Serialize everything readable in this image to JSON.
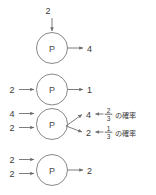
{
  "diagram": {
    "type": "process-node-flow",
    "node_label": "P",
    "rows": [
      {
        "id": "row-1",
        "inputs": [
          {
            "label": "2",
            "direction": "top"
          }
        ],
        "outputs": [
          {
            "label": "4",
            "direction": "right"
          }
        ]
      },
      {
        "id": "row-2",
        "inputs": [
          {
            "label": "2",
            "direction": "left"
          }
        ],
        "outputs": [
          {
            "label": "1",
            "direction": "right"
          }
        ]
      },
      {
        "id": "row-3",
        "inputs": [
          {
            "label": "4",
            "direction": "left"
          },
          {
            "label": "2",
            "direction": "left"
          }
        ],
        "outputs": [
          {
            "label": "4",
            "direction": "right",
            "probability": {
              "numerator": "2",
              "denominator": "3"
            },
            "annotation": "の確率"
          },
          {
            "label": "2",
            "direction": "right",
            "probability": {
              "numerator": "1",
              "denominator": "3"
            },
            "annotation": "の確率"
          }
        ]
      },
      {
        "id": "row-4",
        "inputs": [
          {
            "label": "2",
            "direction": "left"
          },
          {
            "label": "2",
            "direction": "left"
          }
        ],
        "outputs": [
          {
            "label": "2",
            "direction": "right"
          }
        ]
      }
    ]
  },
  "colors": {
    "line": "#6e6e6e",
    "node_stroke": "#7a7a7a",
    "text": "#3b3b3b",
    "background": "#ffffff"
  }
}
